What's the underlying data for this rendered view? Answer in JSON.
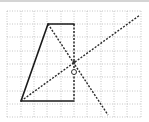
{
  "diagram": {
    "type": "geometry-grid-figure",
    "grid": {
      "x_lines": [
        7,
        21,
        34,
        47,
        61,
        74,
        87,
        101,
        114,
        127,
        141
      ],
      "y_lines": [
        11,
        24,
        37,
        51,
        64,
        77,
        91,
        104,
        117
      ],
      "color": "#b8b8b8"
    },
    "quadrilateral": {
      "solid_edges": [
        {
          "x1": 21,
          "y1": 101,
          "x2": 48,
          "y2": 24
        },
        {
          "x1": 48,
          "y1": 24,
          "x2": 74,
          "y2": 24
        },
        {
          "x1": 21,
          "y1": 101,
          "x2": 74,
          "y2": 101
        }
      ],
      "dashed_edge": {
        "x1": 74,
        "y1": 24,
        "x2": 74,
        "y2": 101
      },
      "color": "#1a1a1a"
    },
    "dashed_lines": [
      {
        "name": "diagonal-from-bottom-left",
        "x1": 21,
        "y1": 101,
        "x2": 140,
        "y2": 15
      },
      {
        "name": "line-from-top-left",
        "x1": 48,
        "y1": 24,
        "x2": 108,
        "y2": 115
      }
    ],
    "intersection_point": {
      "x": 74,
      "y": 62
    },
    "point_O": {
      "label": "O",
      "x": 74,
      "y": 72,
      "r": 2.5
    }
  }
}
